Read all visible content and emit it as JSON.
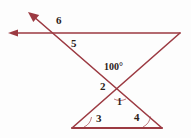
{
  "figure": {
    "stroke_color": "#9c3a42",
    "label_color": "#2b2118",
    "background_color": "#fdfdfd",
    "labels": [
      {
        "id": "angle-6",
        "text": "6"
      },
      {
        "id": "angle-5",
        "text": "5"
      },
      {
        "id": "angle-100",
        "text": "100°"
      },
      {
        "id": "angle-2",
        "text": "2"
      },
      {
        "id": "angle-1",
        "text": "1"
      },
      {
        "id": "angle-3",
        "text": "3"
      },
      {
        "id": "angle-4",
        "text": "4"
      }
    ],
    "geometry": {
      "horizontal_ray": {
        "from": [
          180,
          33
        ],
        "to": [
          8,
          33
        ],
        "arrow_at": "to"
      },
      "upleft_ray": {
        "from": [
          162,
          128
        ],
        "to": [
          28,
          12
        ],
        "arrow_at": "to"
      },
      "right_diagonal": {
        "from": [
          180,
          33
        ],
        "to": [
          72,
          128
        ]
      },
      "baseline": {
        "from": [
          72,
          128
        ],
        "to": [
          162,
          128
        ]
      },
      "upper_intersection": [
        55,
        33
      ],
      "x_crossing": [
        120,
        88
      ]
    }
  }
}
